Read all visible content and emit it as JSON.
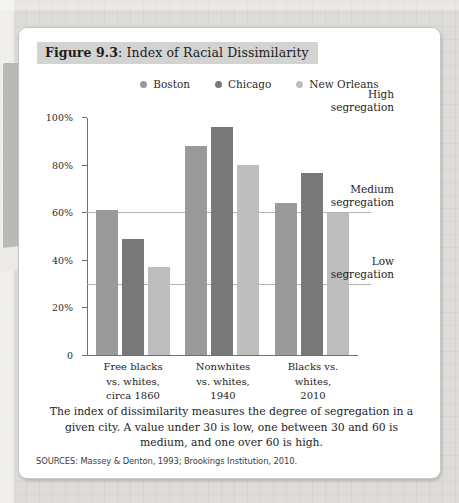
{
  "figure": {
    "number": "Figure 9.3",
    "separator": ": ",
    "title": "Index of Racial Dissimilarity"
  },
  "caption": "The index of dissimilarity measures the degree of segregation in a given city. A value under 30 is low, one between 30 and 60 is medium, and one over 60 is high.",
  "sources": "SOURCES: Massey & Denton, 1993; Brookings Institution, 2010.",
  "colors": {
    "boston": "#9a9a9a",
    "chicago": "#787878",
    "new_orleans": "#bdbdbd",
    "axis": "#6f6f6f",
    "refline": "#b4b4b2",
    "title_band": "#d3d3d1",
    "card": "#ffffff",
    "page": "#dcdcda"
  },
  "zones": [
    {
      "key": "high",
      "label_line1": "High",
      "label_line2": "segregation",
      "at": 100
    },
    {
      "key": "medium",
      "label_line1": "Medium",
      "label_line2": "segregation",
      "at": 60
    },
    {
      "key": "low",
      "label_line1": "Low",
      "label_line2": "segregation",
      "at": 30
    }
  ],
  "reflines": [
    60,
    30
  ],
  "chart_data": {
    "type": "bar",
    "title": "Index of Racial Dissimilarity",
    "xlabel": "",
    "ylabel": "",
    "ylim": [
      0,
      100
    ],
    "yticks": [
      0,
      20,
      40,
      60,
      80,
      100
    ],
    "ytick_labels": [
      "0",
      "20%",
      "40%",
      "60%",
      "80%",
      "100%"
    ],
    "grid": false,
    "legend_position": "top-center",
    "categories": [
      "Free blacks vs. whites, circa 1860",
      "Nonwhites vs. whites, 1940",
      "Blacks vs. whites, 2010"
    ],
    "category_lines": [
      [
        "Free blacks",
        "vs. whites,",
        "circa 1860"
      ],
      [
        "Nonwhites",
        "vs. whites,",
        "1940"
      ],
      [
        "Blacks vs.",
        "whites,",
        "2010"
      ]
    ],
    "series": [
      {
        "name": "Boston",
        "color": "#9a9a9a",
        "values": [
          61,
          88,
          64
        ]
      },
      {
        "name": "Chicago",
        "color": "#787878",
        "values": [
          49,
          96,
          77
        ]
      },
      {
        "name": "New Orleans",
        "color": "#bdbdbd",
        "values": [
          37,
          80,
          60
        ]
      }
    ],
    "annotations": [
      {
        "text": "High segregation",
        "y_range": [
          60,
          100
        ]
      },
      {
        "text": "Medium segregation",
        "y_range": [
          30,
          60
        ]
      },
      {
        "text": "Low segregation",
        "y_range": [
          0,
          30
        ]
      }
    ]
  }
}
